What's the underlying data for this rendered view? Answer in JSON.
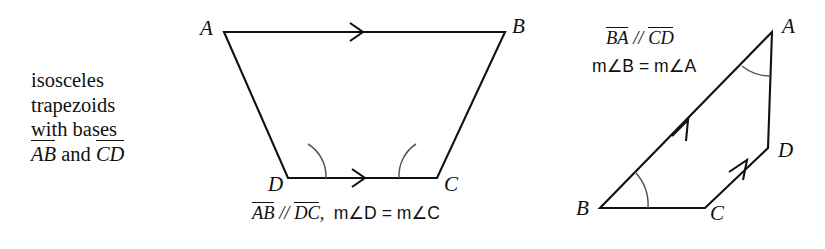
{
  "figure": {
    "description_lines": [
      "isosceles",
      "trapezoids",
      "with bases"
    ],
    "description_bases": {
      "first_segment": "AB",
      "conjunction": "and",
      "second_segment": "CD"
    },
    "left_figure": {
      "vertex_labels": [
        "A",
        "B",
        "C",
        "D"
      ],
      "caption_segment_1": "AB",
      "caption_parallel_symbol": "//",
      "caption_segment_2": "DC",
      "caption_comma": ",",
      "caption_angle_measure": "m∠D = m∠C",
      "marked_parallel_sides": [
        "AB",
        "DC"
      ],
      "marked_congruent_angles": [
        "D",
        "C"
      ]
    },
    "right_figure": {
      "vertex_labels": [
        "A",
        "B",
        "C",
        "D"
      ],
      "caption_segment_1": "BA",
      "caption_parallel_symbol": "//",
      "caption_segment_2": "CD",
      "caption_angle_measure": "m∠B = m∠A",
      "marked_parallel_sides": [
        "BA",
        "CD"
      ],
      "marked_congruent_angles": [
        "B",
        "A"
      ]
    },
    "colors": {
      "background": "#ffffff",
      "ink": "#111111",
      "arc": "#555555"
    }
  }
}
